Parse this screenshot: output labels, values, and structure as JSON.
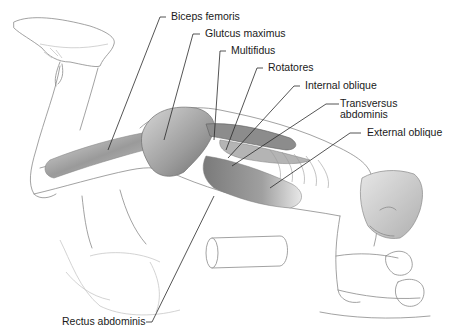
{
  "figure": {
    "labels": [
      {
        "id": "biceps-femoris",
        "text": "Biceps femoris"
      },
      {
        "id": "gluteus-maximus",
        "text": "Glutcus maximus"
      },
      {
        "id": "multifidus",
        "text": "Multifidus"
      },
      {
        "id": "rotatores",
        "text": "Rotatores"
      },
      {
        "id": "internal-oblique",
        "text": "Internal oblique"
      },
      {
        "id": "transversus-abdominis",
        "text": "Transversus",
        "text2": "abdominis"
      },
      {
        "id": "external-oblique",
        "text": "External oblique"
      },
      {
        "id": "rectus-abdominis",
        "text": "Rectus abdominis"
      }
    ]
  },
  "colors": {
    "background": "#ffffff",
    "line_art": "#8a8a8a",
    "muscle_dark": "#7a7a7a",
    "muscle_mid": "#a8a8a8",
    "muscle_light": "#d2d2d2",
    "label_text": "#1a1a1a"
  }
}
